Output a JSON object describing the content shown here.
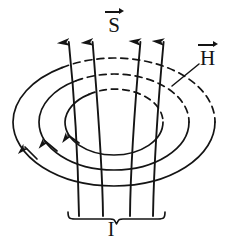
{
  "figure": {
    "background_color": "#ffffff",
    "stroke_color": "#141414",
    "width": 234,
    "height": 243
  },
  "labels": {
    "poynting": {
      "symbol": "S",
      "vector": true,
      "position": "top-center"
    },
    "magnetic_field": {
      "symbol": "H",
      "vector": true,
      "position": "right"
    },
    "current": {
      "symbol": "I",
      "vector": false,
      "position": "bottom-center"
    }
  },
  "field_lines": {
    "h_lines": {
      "name": "concentric-ellipses",
      "count": 3,
      "direction": "counterclockwise",
      "arrowhead_count": 3,
      "hidden_back_style": "dashed",
      "ellipses": [
        {
          "cx": 114,
          "cy": 122,
          "rx": 101,
          "ry": 64
        },
        {
          "cx": 114,
          "cy": 122,
          "rx": 75,
          "ry": 48
        },
        {
          "cx": 114,
          "cy": 122,
          "rx": 49,
          "ry": 33
        }
      ]
    },
    "s_lines": {
      "name": "vertical-poynting-lines",
      "count": 4,
      "direction": "upward",
      "x_bottom": [
        79,
        103,
        130,
        153
      ],
      "x_top": [
        68,
        92,
        141,
        164
      ],
      "y_top": 30,
      "y_bottom": 216
    }
  },
  "brace": {
    "name": "current-brace",
    "x_left": 68,
    "x_right": 165,
    "y": 218,
    "label": "I"
  },
  "leader": {
    "name": "h-leader-line",
    "from_x": 199,
    "from_y": 64,
    "to_x": 172,
    "to_y": 86
  }
}
